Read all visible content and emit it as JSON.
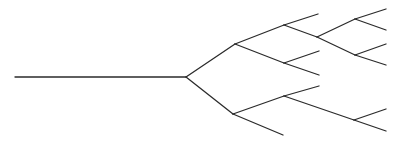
{
  "diagram": {
    "type": "tree",
    "stroke_color": "#2b2b2b",
    "background": "#ffffff",
    "nodes": {
      "start": [
        15,
        77
      ],
      "root": [
        186,
        77
      ],
      "A": [
        235,
        44
      ],
      "B": [
        233,
        114
      ],
      "C": [
        284,
        25
      ],
      "G": [
        284,
        63
      ],
      "H": [
        284,
        96
      ],
      "D": [
        317,
        37
      ],
      "E": [
        355,
        19
      ],
      "F": [
        355,
        55
      ],
      "I": [
        354,
        120
      ],
      "leafC1": [
        318,
        14
      ],
      "leafE1": [
        386,
        9
      ],
      "leafE2": [
        386,
        30
      ],
      "leafF1": [
        386,
        44
      ],
      "leafF2": [
        386,
        65
      ],
      "leafG1": [
        319,
        51
      ],
      "leafG2": [
        319,
        75
      ],
      "leafH1": [
        319,
        86
      ],
      "leafI1": [
        386,
        109
      ],
      "leafI2": [
        386,
        131
      ],
      "leafB1": [
        283,
        135
      ]
    },
    "edges": [
      [
        "start",
        "root"
      ],
      [
        "root",
        "A"
      ],
      [
        "root",
        "B"
      ],
      [
        "A",
        "C"
      ],
      [
        "A",
        "G"
      ],
      [
        "C",
        "leafC1"
      ],
      [
        "C",
        "D"
      ],
      [
        "D",
        "E"
      ],
      [
        "D",
        "F"
      ],
      [
        "E",
        "leafE1"
      ],
      [
        "E",
        "leafE2"
      ],
      [
        "F",
        "leafF1"
      ],
      [
        "F",
        "leafF2"
      ],
      [
        "G",
        "leafG1"
      ],
      [
        "G",
        "leafG2"
      ],
      [
        "B",
        "H"
      ],
      [
        "B",
        "leafB1"
      ],
      [
        "H",
        "leafH1"
      ],
      [
        "H",
        "I"
      ],
      [
        "I",
        "leafI1"
      ],
      [
        "I",
        "leafI2"
      ]
    ]
  }
}
